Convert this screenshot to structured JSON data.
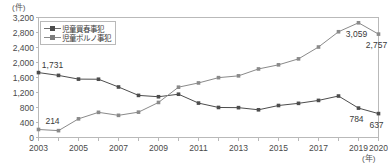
{
  "chart_data": {
    "type": "line",
    "title": "",
    "xlabel": "(年)",
    "ylabel": "(件)",
    "x": [
      2003,
      2004,
      2005,
      2006,
      2007,
      2008,
      2009,
      2010,
      2011,
      2012,
      2013,
      2014,
      2015,
      2016,
      2017,
      2018,
      2019,
      2020
    ],
    "xlim": [
      2003,
      2020
    ],
    "ylim": [
      0,
      3200
    ],
    "yticks": [
      0,
      400,
      800,
      1200,
      1600,
      2000,
      2400,
      2800,
      3200
    ],
    "ytick_labels": [
      "0",
      "400",
      "800",
      "1,200",
      "1,600",
      "2,000",
      "2,400",
      "2,800",
      "3,200"
    ],
    "xtick_labels": [
      "2003",
      "2005",
      "2007",
      "2009",
      "2011",
      "2013",
      "2015",
      "2017",
      "2019",
      "2020"
    ],
    "xtick_values": [
      2003,
      2005,
      2007,
      2009,
      2011,
      2013,
      2015,
      2017,
      2019,
      2020
    ],
    "grid": false,
    "legend_position": "upper-left-inside",
    "series": [
      {
        "name": "児童買春事犯",
        "color": "#4d4d4d",
        "values": [
          1731,
          1656,
          1557,
          1554,
          1347,
          1123,
          1087,
          1154,
          918,
          801,
          796,
          739,
          853,
          911,
          989,
          1106,
          784,
          637
        ]
      },
      {
        "name": "児童ポルノ事犯",
        "color": "#8a8a8a",
        "values": [
          214,
          183,
          498,
          671,
          591,
          676,
          935,
          1342,
          1455,
          1596,
          1644,
          1828,
          1938,
          2097,
          2413,
          2820,
          3059,
          2757
        ]
      }
    ],
    "annotations": [
      {
        "text": "1,731",
        "x": 2003,
        "y": 1731,
        "series": "児童買春事犯",
        "placement": "above-right"
      },
      {
        "text": "214",
        "x": 2003,
        "y": 214,
        "series": "児童ポルノ事犯",
        "placement": "above-right"
      },
      {
        "text": "3,059",
        "x": 2019,
        "y": 3059,
        "series": "児童ポルノ事犯",
        "placement": "below-left"
      },
      {
        "text": "2,757",
        "x": 2020,
        "y": 2757,
        "series": "児童ポルノ事犯",
        "placement": "below-left"
      },
      {
        "text": "784",
        "x": 2019,
        "y": 784,
        "series": "児童買春事犯",
        "placement": "below-left"
      },
      {
        "text": "637",
        "x": 2020,
        "y": 637,
        "series": "児童買春事犯",
        "placement": "below-left"
      }
    ]
  },
  "legend": {
    "items": [
      {
        "label": "児童買春事犯"
      },
      {
        "label": "児童ポルノ事犯"
      }
    ]
  },
  "axes": {
    "y_unit": "(件)",
    "x_unit": "(年)"
  }
}
